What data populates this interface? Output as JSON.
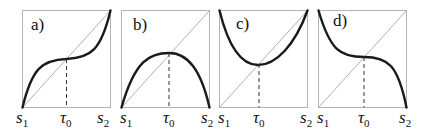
{
  "panels": [
    {
      "label": "a)",
      "x_start": "s",
      "x_start_sub": "1",
      "x_mid": "τ",
      "x_mid_sub": "0",
      "x_end": "s",
      "x_end_sub": "2",
      "curve_shape": "cubic-increasing"
    },
    {
      "label": "b)",
      "x_start": "s",
      "x_start_sub": "1",
      "x_mid": "τ",
      "x_mid_sub": "0",
      "x_end": "s",
      "x_end_sub": "2",
      "curve_shape": "concave-maximum"
    },
    {
      "label": "c)",
      "x_start": "s",
      "x_start_sub": "1",
      "x_mid": "τ",
      "x_mid_sub": "0",
      "x_end": "s",
      "x_end_sub": "2",
      "curve_shape": "convex-minimum"
    },
    {
      "label": "d)",
      "x_start": "s",
      "x_start_sub": "1",
      "x_mid": "τ",
      "x_mid_sub": "0",
      "x_end": "s",
      "x_end_sub": "2",
      "curve_shape": "cubic-decreasing"
    }
  ],
  "colors": {
    "curve": "#1a1a1a",
    "frame": "#b4b4b4",
    "diagonal": "#a8a8a8"
  }
}
